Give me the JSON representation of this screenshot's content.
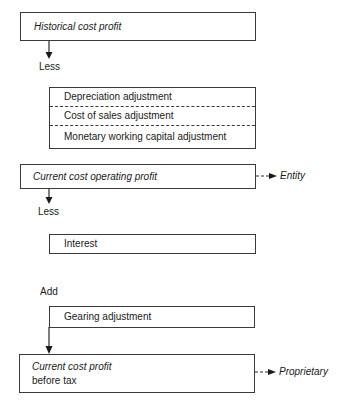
{
  "diagram": {
    "historical_box": {
      "label": "Historical cost profit"
    },
    "less_label_1": "Less",
    "adjustments_box": {
      "items": [
        "Depreciation adjustment",
        "Cost of sales adjustment",
        "Monetary working capital adjustment"
      ]
    },
    "operating_box": {
      "label": "Current cost operating profit",
      "arrow_target": "Entity"
    },
    "less_label_2": "Less",
    "interest_box": {
      "label": "Interest"
    },
    "add_label": "Add",
    "gearing_box": {
      "label": "Gearing adjustment"
    },
    "profit_box": {
      "label_line1": "Current cost profit",
      "label_line2": "before tax",
      "arrow_target": "Proprietary"
    },
    "colors": {
      "line": "#3a3a3a",
      "text": "#1a1a1a",
      "background": "#ffffff"
    }
  }
}
